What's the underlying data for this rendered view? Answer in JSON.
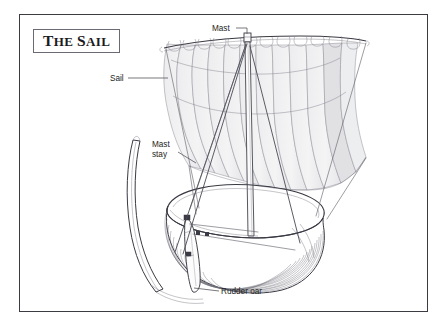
{
  "figure": {
    "title_display_upper": "THE SAIL",
    "title_words": [
      {
        "initial": "T",
        "rest": "HE"
      },
      {
        "initial": "S",
        "rest": "AIL"
      }
    ],
    "style": "black and white line-art technical illustration",
    "frame_border_color": "#3b3b43",
    "background_color": "#ffffff",
    "ink_color": "#3a3a44",
    "sail_fill_color": "#f0f0f0",
    "sail_fill_color_shaded": "#e3e3e5",
    "label_color": "#1d1d22",
    "leader_color": "#55555d"
  },
  "annotations": [
    {
      "id": "mast",
      "label": "Mast",
      "lines": [
        "Mast"
      ],
      "text_x": 212,
      "text_y": 31,
      "anchor": "start",
      "leader": "M 236 28 L 247 28 L 247 35"
    },
    {
      "id": "sail",
      "label": "Sail",
      "lines": [
        "Sail"
      ],
      "text_x": 110,
      "text_y": 81,
      "anchor": "start",
      "leader": "M 128 78 L 166 78"
    },
    {
      "id": "mast-stay",
      "label": "Mast stay",
      "lines": [
        "Mast",
        "stay"
      ],
      "text_x": 152,
      "text_y": 147,
      "anchor": "start",
      "leader": "M 176 158 L 192 166"
    },
    {
      "id": "rudder-oar",
      "label": "Rudder oar",
      "lines": [
        "Rudder oar"
      ],
      "text_x": 221,
      "text_y": 294,
      "anchor": "start",
      "leader": "M 190 288 L 218 291"
    }
  ],
  "parts": [
    {
      "id": "mast",
      "name": "Mast"
    },
    {
      "id": "sail",
      "name": "Sail"
    },
    {
      "id": "mast-stay",
      "name": "Mast stay"
    },
    {
      "id": "rudder-oar",
      "name": "Rudder oar"
    },
    {
      "id": "yard",
      "name": "Yard"
    },
    {
      "id": "hull",
      "name": "Clinker-built hull"
    },
    {
      "id": "stem-post",
      "name": "Stem post"
    }
  ]
}
